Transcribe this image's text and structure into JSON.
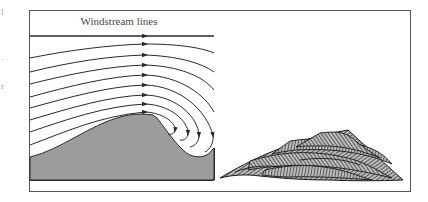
{
  "figure": {
    "title_label": "Windstream lines",
    "panels": [
      {
        "id": "left",
        "description": "Airflow streamlines over a dune with lee-side eddy"
      },
      {
        "id": "right",
        "description": "Dune cross-section showing cross-bedding"
      }
    ],
    "streamline_count": 9,
    "colors": {
      "stroke": "#2a2a2a",
      "ground_fill": "#9c9c9c",
      "hatch_fill": "#8a8a8a",
      "frame": "#555555",
      "background": "#ffffff"
    },
    "edge_glyphs": [
      "l",
      "·",
      "r"
    ]
  }
}
